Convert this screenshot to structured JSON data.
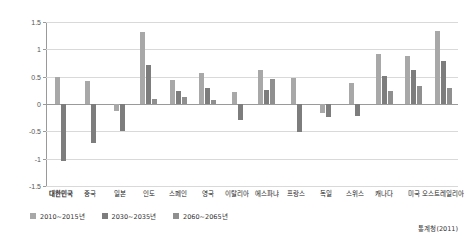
{
  "chart_data": {
    "type": "bar",
    "title": "",
    "subtitle": "",
    "xlabel": "",
    "ylabel": "",
    "ylim": [
      -1.5,
      1.5
    ],
    "ytick_labels": [
      "1.5",
      "1",
      "0.5",
      "0",
      "-0.5",
      "-1",
      "-1.5"
    ],
    "ytick_values": [
      1.5,
      1.0,
      0.5,
      0.0,
      -0.5,
      -1.0,
      -1.5
    ],
    "grid": true,
    "legend_position": "bottom-left",
    "categories": [
      "대한민국",
      "중국",
      "일본",
      "인도",
      "스페인",
      "영국",
      "이탈리아",
      "에스파냐",
      "프랑스",
      "독일",
      "스위스",
      "캐나다",
      "미국",
      "오스트레일리아"
    ],
    "highlight_category": "대한민국",
    "series": [
      {
        "name": "2010~2015년",
        "color": "#a8a8a8",
        "values": [
          0.49,
          0.42,
          -0.13,
          1.31,
          0.43,
          0.57,
          0.22,
          0.62,
          0.47,
          -0.17,
          0.38,
          0.92,
          0.88,
          1.33
        ]
      },
      {
        "name": "2030~2035년",
        "color": "#7d7d7d",
        "values": [
          -1.05,
          -0.72,
          -0.5,
          0.72,
          0.23,
          0.3,
          -0.3,
          0.26,
          -0.52,
          -0.23,
          -0.22,
          0.52,
          0.62,
          0.78
        ]
      },
      {
        "name": "2060~2065년",
        "color": "#8f8f8f",
        "values": [
          0.0,
          0.0,
          0.0,
          0.1,
          0.12,
          0.08,
          0.0,
          0.45,
          0.0,
          0.0,
          0.0,
          0.23,
          0.33,
          0.3
        ]
      }
    ],
    "source": "통계청(2011)"
  },
  "legend": {
    "items": [
      {
        "label": "2010~2015년"
      },
      {
        "label": "2030~2035년"
      },
      {
        "label": "2060~2065년"
      }
    ]
  },
  "source_note": "통계청(2011)"
}
